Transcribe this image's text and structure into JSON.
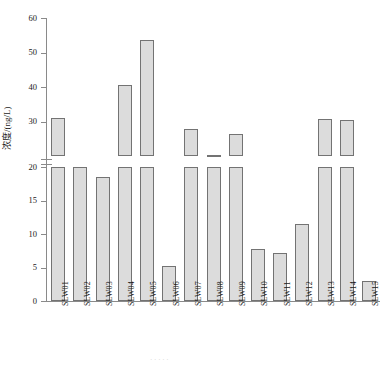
{
  "chart_data": {
    "type": "bar",
    "title": "",
    "subtitle": "",
    "xlabel": "",
    "ylabel": "浓度/(ng/L)",
    "categories": [
      "SLW01",
      "SLW02",
      "SLW03",
      "SLW04",
      "SLW05",
      "SLW06",
      "SLW07",
      "SLW08",
      "SLW09",
      "SLW10",
      "SLW11",
      "SLW12",
      "SLW13",
      "SLW14",
      "SLW15"
    ],
    "values": [
      31.0,
      20.0,
      18.5,
      40.7,
      53.5,
      5.2,
      27.8,
      20.4,
      26.5,
      7.8,
      7.2,
      11.5,
      30.8,
      30.5,
      3.0
    ],
    "series": [
      {
        "name": "浓度",
        "values": [
          31.0,
          20.0,
          18.5,
          40.7,
          53.5,
          5.2,
          27.8,
          20.4,
          26.5,
          7.8,
          7.2,
          11.5,
          30.8,
          30.5,
          3.0
        ]
      }
    ],
    "ylim": [
      0,
      60
    ],
    "y_ticks": [
      0,
      5,
      10,
      15,
      20,
      30,
      40,
      50,
      60
    ],
    "y_tick_labels": [
      "0",
      "5",
      "10",
      "15",
      "20",
      "30",
      "40",
      "50",
      "60"
    ],
    "axis_break": {
      "present": true,
      "lower_max": 20,
      "upper_min": 20,
      "note": "broken y-axis between lower 0-20 segment and upper 20-60 segment"
    },
    "grid": false,
    "legend": null,
    "legend_position": "none",
    "bar_fill_color": "#dcdcdc",
    "bar_border_color": "#737373",
    "axis_color": "#8a8a8a",
    "background_color": "#ffffff",
    "annotations": []
  },
  "figure": {
    "caption": "· · · · ·",
    "y_axis_title": "浓度/(ng/L)"
  }
}
